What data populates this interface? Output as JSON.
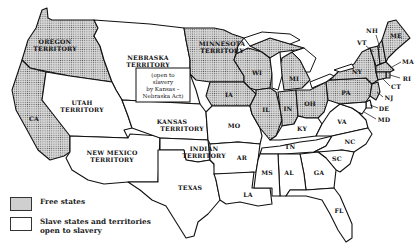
{
  "map": {
    "title": "",
    "colors": {
      "free": "#cfcfcf",
      "slave": "#ffffff",
      "border": "#111111"
    },
    "regions": [
      {
        "label": "OREGON TERRITORY",
        "status": "free"
      },
      {
        "label": "NEBRASKA TERRITORY",
        "status": "slave"
      },
      {
        "label": "MINNESOTA TERRITORY",
        "status": "free"
      },
      {
        "label": "UTAH TERRITORY",
        "status": "slave"
      },
      {
        "label": "CA",
        "status": "free"
      },
      {
        "label": "NEW MEXICO TERRITORY",
        "status": "slave"
      },
      {
        "label": "KANSAS TERRITORY",
        "status": "slave"
      },
      {
        "label": "INDIAN TERRITORY",
        "status": "slave"
      },
      {
        "label": "TEXAS",
        "status": "slave"
      },
      {
        "label": "WI",
        "status": "free"
      },
      {
        "label": "MI",
        "status": "free"
      },
      {
        "label": "IA",
        "status": "free"
      },
      {
        "label": "IL",
        "status": "free"
      },
      {
        "label": "IN",
        "status": "free"
      },
      {
        "label": "OH",
        "status": "free"
      },
      {
        "label": "PA",
        "status": "free"
      },
      {
        "label": "NY",
        "status": "free"
      },
      {
        "label": "VT",
        "status": "free"
      },
      {
        "label": "NH",
        "status": "free"
      },
      {
        "label": "ME",
        "status": "free"
      },
      {
        "label": "MA",
        "status": "free"
      },
      {
        "label": "RI",
        "status": "free"
      },
      {
        "label": "CT",
        "status": "free"
      },
      {
        "label": "NJ",
        "status": "free"
      },
      {
        "label": "DE",
        "status": "slave"
      },
      {
        "label": "MD",
        "status": "slave"
      },
      {
        "label": "MO",
        "status": "slave"
      },
      {
        "label": "KY",
        "status": "slave"
      },
      {
        "label": "VA",
        "status": "slave"
      },
      {
        "label": "TN",
        "status": "slave"
      },
      {
        "label": "NC",
        "status": "slave"
      },
      {
        "label": "AR",
        "status": "slave"
      },
      {
        "label": "SC",
        "status": "slave"
      },
      {
        "label": "MS",
        "status": "slave"
      },
      {
        "label": "AL",
        "status": "slave"
      },
      {
        "label": "GA",
        "status": "slave"
      },
      {
        "label": "LA",
        "status": "slave"
      },
      {
        "label": "FL",
        "status": "slave"
      }
    ],
    "labels": {
      "oregon_1": "OREGON",
      "oregon_2": "TERRITORY",
      "nebraska_1": "NEBRASKA",
      "nebraska_2": "TERRITORY",
      "minnesota_1": "MINNESOTA",
      "minnesota_2": "TERRITORY",
      "utah_1": "UTAH",
      "utah_2": "TERRITORY",
      "ca": "CA",
      "nm_1": "NEW MEXICO",
      "nm_2": "TERRITORY",
      "kansas_1": "KANSAS",
      "kansas_2": "TERRITORY",
      "indian_1": "INDIAN",
      "indian_2": "TERRITORY",
      "texas": "TEXAS",
      "wi": "WI",
      "mi": "MI",
      "ia": "IA",
      "il": "IL",
      "in": "IN",
      "oh": "OH",
      "pa": "PA",
      "ny": "NY",
      "vt": "VT",
      "nh": "NH",
      "me": "ME",
      "ma": "MA",
      "ri": "RI",
      "ct": "CT",
      "nj": "NJ",
      "de": "DE",
      "md": "MD",
      "mo": "MO",
      "ky": "KY",
      "va": "VA",
      "tn": "TN",
      "nc": "NC",
      "ar": "AR",
      "sc": "SC",
      "ms": "MS",
      "al": "AL",
      "ga": "GA",
      "la": "LA",
      "fl": "FL"
    },
    "note": {
      "line1": "(open to",
      "line2": "slavery",
      "line3": "by Kansas –",
      "line4": "Nebraska Act)"
    }
  },
  "legend": {
    "items": [
      {
        "label": "Free states",
        "swatch": "free"
      },
      {
        "label_line1": "Slave states and territories",
        "label_line2": "open to slavery",
        "swatch": "slave"
      }
    ]
  }
}
